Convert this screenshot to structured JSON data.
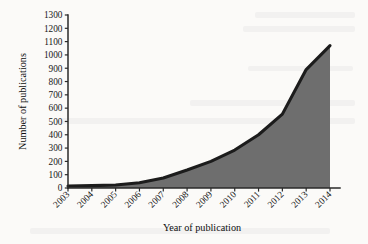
{
  "chart_data": {
    "type": "area",
    "title": "",
    "xlabel": "Year of publication",
    "ylabel": "Number of publications",
    "categories": [
      "2003",
      "2004",
      "2005",
      "2006",
      "2007",
      "2008",
      "2009",
      "2010",
      "2011",
      "2012",
      "2013",
      "2014"
    ],
    "values": [
      15,
      18,
      22,
      40,
      75,
      135,
      200,
      285,
      400,
      555,
      890,
      1070
    ],
    "series": [
      {
        "name": "Number of publications",
        "values": [
          15,
          18,
          22,
          40,
          75,
          135,
          200,
          285,
          400,
          555,
          890,
          1070
        ]
      }
    ],
    "ylim": [
      0,
      1300
    ],
    "ytick_values": [
      0,
      100,
      200,
      300,
      400,
      500,
      600,
      700,
      800,
      900,
      1000,
      1100,
      1200,
      1300
    ],
    "ytick_labels": [
      "0",
      "100",
      "200",
      "300",
      "400",
      "500",
      "600",
      "700",
      "800",
      "900",
      "1000",
      "1100",
      "1200",
      "1300"
    ],
    "xtick_labels": [
      "2003",
      "2004",
      "2005",
      "2006",
      "2007",
      "2008",
      "2009",
      "2010",
      "2011",
      "2012",
      "2013",
      "2014"
    ],
    "grid": false,
    "legend": "none",
    "xtick_rotation": 45,
    "colors": {
      "area_fill": "#6e6e6e",
      "area_line": "#1c1c1c",
      "axis": "#2a2a2a",
      "text": "#161616",
      "background": "#fbfaf8"
    }
  }
}
